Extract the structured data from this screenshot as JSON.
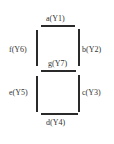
{
  "segments": {
    "a": {
      "label": "a(Y1)"
    },
    "b": {
      "label": "b(Y2)"
    },
    "c": {
      "label": "c(Y3)"
    },
    "d": {
      "label": "d(Y4)"
    },
    "e": {
      "label": "e(Y5)"
    },
    "f": {
      "label": "f(Y6)"
    },
    "g": {
      "label": "g(Y7)"
    }
  },
  "colors": {
    "segment": "#2a2a2a",
    "text": "#333333",
    "background": "#ffffff"
  }
}
